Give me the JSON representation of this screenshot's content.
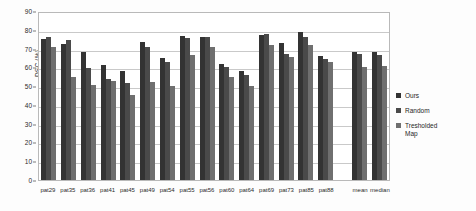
{
  "chart_data": {
    "type": "bar",
    "title": "",
    "xlabel": "",
    "ylabel": "DSC (%)",
    "ylim": [
      0,
      90
    ],
    "ytick_values": [
      0,
      10,
      20,
      30,
      40,
      50,
      60,
      70,
      80,
      90
    ],
    "grid": true,
    "legend_position": "right",
    "categories": [
      "pat29",
      "pat35",
      "pat36",
      "pat41",
      "pat45",
      "pat49",
      "pat54",
      "pat55",
      "pat56",
      "pat60",
      "pat64",
      "pat69",
      "pat73",
      "pat85",
      "pat88",
      "mean",
      "median"
    ],
    "series": [
      {
        "name": "Ours",
        "color": "#333333",
        "values": [
          75,
          72.5,
          68,
          61,
          58,
          73.5,
          65,
          76.5,
          76,
          62,
          58,
          77,
          73,
          79,
          66,
          68,
          68
        ]
      },
      {
        "name": "Random",
        "color": "#4a4a4a",
        "values": [
          76,
          74.5,
          59.5,
          54,
          51.5,
          71,
          63,
          75.5,
          76,
          60,
          56,
          78,
          67,
          76,
          64.5,
          67,
          66.5
        ]
      },
      {
        "name": "Tresholded Map",
        "color": "#6f6f6f",
        "values": [
          71,
          55,
          50.5,
          52.5,
          45.5,
          52,
          50,
          66.5,
          71,
          55,
          50,
          72,
          65.5,
          72,
          63,
          60,
          60.5
        ]
      }
    ],
    "legend": [
      {
        "label": "Ours",
        "color": "#333333"
      },
      {
        "label": "Random",
        "color": "#4a4a4a"
      },
      {
        "label": "Tresholded\nMap",
        "color": "#6f6f6f"
      }
    ]
  }
}
